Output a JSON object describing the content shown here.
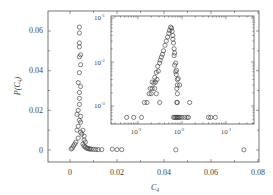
{
  "chart_data": [
    {
      "type": "scatter",
      "name": "main",
      "xlabel": "C4",
      "ylabel": "P(C4)",
      "xlim": [
        -0.006,
        0.08
      ],
      "ylim": [
        -0.005,
        0.07
      ],
      "xticks": [
        "0",
        "0.02",
        "0.04",
        "0.06",
        "0.08"
      ],
      "yticks": [
        "0",
        "0.02",
        "0.04",
        "0.06"
      ],
      "marker": "open-circle",
      "x": [
        0.004,
        0.004,
        0.004,
        0.004,
        0.0045,
        0.004,
        0.0045,
        0.004,
        0.0035,
        0.0045,
        0.004,
        0.004,
        0.004,
        0.0035,
        0.003,
        0.0045,
        0.004,
        0.0045,
        0.0035,
        0.003,
        0.0045,
        0.0055,
        0.005,
        0.006,
        0.006,
        0.0065,
        0.0035,
        0.0025,
        0.002,
        0.0015,
        0.001,
        0.0005,
        0.0055,
        0.006,
        0.0065,
        0.007,
        0.0075,
        0.008,
        0.0085,
        0.009,
        0.01,
        0.011,
        0.012,
        0.0135,
        0.018,
        0.02,
        0.022,
        0.045,
        0.074
      ],
      "y": [
        0.062,
        0.059,
        0.054,
        0.052,
        0.048,
        0.047,
        0.043,
        0.039,
        0.034,
        0.032,
        0.029,
        0.026,
        0.023,
        0.02,
        0.018,
        0.017,
        0.015,
        0.014,
        0.012,
        0.01,
        0.009,
        0.01,
        0.008,
        0.007,
        0.005,
        0.004,
        0.006,
        0.004,
        0.003,
        0.002,
        0.001,
        0.0005,
        0.003,
        0.002,
        0.0015,
        0.001,
        0.0008,
        0.0006,
        0.0005,
        0.0004,
        0.0003,
        0.0002,
        0.0002,
        0.0002,
        0.0004,
        0.0002,
        0.0002,
        0.0001,
        0.0001
      ]
    },
    {
      "type": "scatter",
      "name": "inset",
      "xscale": "log",
      "yscale": "log",
      "xticks": [
        "10^-3",
        "10^-2",
        "10^-1"
      ],
      "yticks": [
        "10^-3",
        "10^-2",
        "10^-1"
      ],
      "marker": "open-circle",
      "x": [
        0.0055,
        0.0058,
        0.0052,
        0.006,
        0.005,
        0.0062,
        0.0047,
        0.0062,
        0.0044,
        0.0064,
        0.0041,
        0.0066,
        0.0038,
        0.0068,
        0.0036,
        0.0066,
        0.0034,
        0.0072,
        0.0032,
        0.0068,
        0.0031,
        0.0075,
        0.0028,
        0.0072,
        0.0026,
        0.0029,
        0.0074,
        0.0082,
        0.0024,
        0.0027,
        0.0078,
        0.0021,
        0.0023,
        0.0025,
        0.0078,
        0.0088,
        0.0019,
        0.0021,
        0.0024,
        0.0076,
        0.0018,
        0.002,
        0.0026,
        0.0078,
        0.0014,
        0.0016,
        0.0031,
        0.0076,
        0.0078,
        0.015,
        0.00055,
        0.0008,
        0.0012,
        0.0064,
        0.0068,
        0.0072,
        0.0076,
        0.008,
        0.0085,
        0.009,
        0.01,
        0.0115,
        0.013,
        0.014,
        0.04,
        0.045,
        0.057
      ],
      "y": [
        0.062,
        0.059,
        0.052,
        0.05,
        0.045,
        0.04,
        0.037,
        0.033,
        0.03,
        0.027,
        0.024,
        0.02,
        0.018,
        0.016,
        0.015,
        0.014,
        0.013,
        0.0095,
        0.011,
        0.0085,
        0.0095,
        0.0065,
        0.008,
        0.006,
        0.0058,
        0.0062,
        0.0052,
        0.0042,
        0.0045,
        0.004,
        0.004,
        0.0035,
        0.0033,
        0.0035,
        0.003,
        0.003,
        0.0025,
        0.0025,
        0.0025,
        0.0025,
        0.0019,
        0.0019,
        0.0019,
        0.0019,
        0.0012,
        0.0012,
        0.0012,
        0.0012,
        0.0012,
        0.0012,
        0.00055,
        0.00055,
        0.00055,
        0.00055,
        0.00055,
        0.00055,
        0.00055,
        0.00055,
        0.00055,
        0.00055,
        0.00055,
        0.00055,
        0.00055,
        0.00055,
        0.00055,
        0.00055,
        0.00055
      ]
    }
  ],
  "labels": {
    "xlabel_main": "C",
    "xlabel_sub": "4",
    "ylabel_main": "P(C",
    "ylabel_sub": "4",
    "ylabel_close": ")",
    "main_xticks": [
      "0",
      "0.02",
      "0.04",
      "0.06",
      "0.08"
    ],
    "main_yticks": [
      "0",
      "0.02",
      "0.04",
      "0.06"
    ],
    "inset_tick_base": "10",
    "inset_xticks_exp": [
      "-3",
      "-2",
      "-1"
    ],
    "inset_yticks_exp": [
      "-3",
      "-2",
      "-1"
    ]
  }
}
